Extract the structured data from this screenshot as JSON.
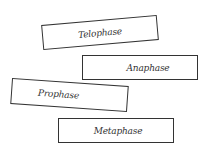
{
  "cards": [
    {
      "label": "Telophase"
    },
    {
      "label": "Anaphase"
    },
    {
      "label": "Prophase"
    },
    {
      "label": "Metaphase"
    }
  ]
}
